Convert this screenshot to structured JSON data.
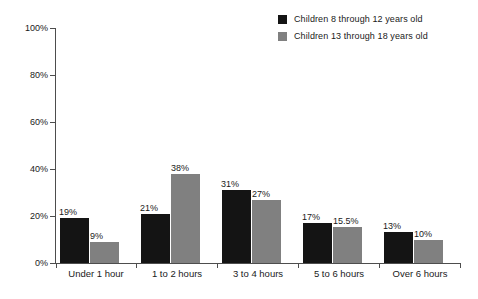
{
  "chart_data": {
    "type": "bar",
    "title": "",
    "xlabel": "",
    "ylabel": "",
    "ylim": [
      0,
      100
    ],
    "ytick_labels": [
      "0%",
      "20%",
      "40%",
      "60%",
      "80%",
      "100%"
    ],
    "ytick_values": [
      0,
      20,
      40,
      60,
      80,
      100
    ],
    "grid": false,
    "legend_position": "top-right",
    "categories": [
      "Under 1 hour",
      "1 to 2 hours",
      "3 to 4 hours",
      "5 to 6 hours",
      "Over 6 hours"
    ],
    "series": [
      {
        "name": "Children 8 through 12 years old",
        "color": "#141414",
        "values": [
          19,
          21,
          31,
          17,
          13
        ],
        "labels": [
          "19%",
          "21%",
          "31%",
          "17%",
          "13%"
        ]
      },
      {
        "name": "Children 13 through 18 years old",
        "color": "#808080",
        "values": [
          9,
          38,
          27,
          15.5,
          10
        ],
        "labels": [
          "9%",
          "38%",
          "27%",
          "15.5%",
          "10%"
        ]
      }
    ]
  },
  "legend": {
    "items": [
      {
        "label": "Children 8 through 12 years old",
        "swatch": "legend-swatch-black"
      },
      {
        "label": "Children 13 through 18 years old",
        "swatch": "legend-swatch-gray"
      }
    ]
  }
}
